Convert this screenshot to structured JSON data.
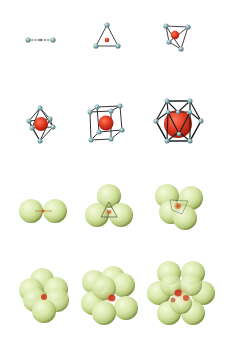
{
  "figure": {
    "background": "#ffffff",
    "colors": {
      "central_atom": "#e03a22",
      "ligand_ball_stick": "#7fa9ab",
      "bond": "#333333",
      "ligand_space_filling": "#d8e6a8",
      "ligand_space_filling_shade": "#98ab5a"
    },
    "ball_and_stick_models": [
      {
        "id": "linear",
        "coordination_number": 2,
        "cx": 40,
        "cy": 40
      },
      {
        "id": "trigonal-planar",
        "coordination_number": 3,
        "cx": 106,
        "cy": 38
      },
      {
        "id": "tetrahedral",
        "coordination_number": 4,
        "cx": 175,
        "cy": 37
      },
      {
        "id": "octahedral",
        "coordination_number": 6,
        "cx": 40,
        "cy": 122
      },
      {
        "id": "cubic",
        "coordination_number": 8,
        "cx": 106,
        "cy": 123
      },
      {
        "id": "cuboctahedral",
        "coordination_number": 12,
        "cx": 178,
        "cy": 121
      }
    ],
    "space_filling_models": [
      {
        "id": "linear",
        "coordination_number": 2,
        "cx": 43,
        "cy": 211
      },
      {
        "id": "trigonal-planar",
        "coordination_number": 3,
        "cx": 109,
        "cy": 207
      },
      {
        "id": "tetrahedral",
        "coordination_number": 4,
        "cx": 178,
        "cy": 205
      },
      {
        "id": "octahedral",
        "coordination_number": 6,
        "cx": 43,
        "cy": 295
      },
      {
        "id": "cubic",
        "coordination_number": 8,
        "cx": 108,
        "cy": 296
      },
      {
        "id": "cuboctahedral",
        "coordination_number": 12,
        "cx": 180,
        "cy": 293
      }
    ]
  }
}
